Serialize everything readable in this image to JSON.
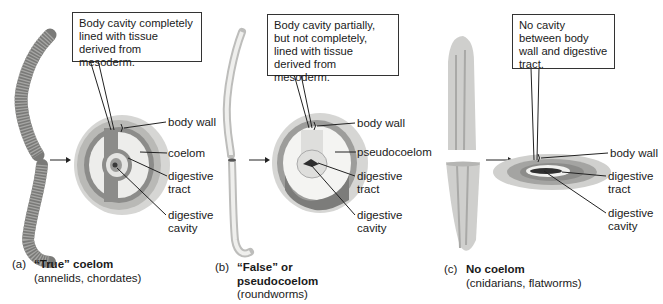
{
  "panels": [
    {
      "id": "a",
      "letter": "(a)",
      "title": "“True” coelom",
      "title_line2": "",
      "subtitle": "(annelids, chordates)",
      "callout": "Body cavity completely lined with tissue derived from mesoderm.",
      "organism": "annelid earthworm",
      "labels": [
        "body wall",
        "coelom",
        "digestive tract",
        "digestive cavity"
      ]
    },
    {
      "id": "b",
      "letter": "(b)",
      "title": "“False” or",
      "title_line2": "pseudocoelom",
      "subtitle": "(roundworms)",
      "callout": "Body cavity partially, but not completely, lined with tissue derived from mesoderm.",
      "organism": "roundworm",
      "labels": [
        "body wall",
        "pseudocoelom",
        "digestive tract",
        "digestive cavity"
      ]
    },
    {
      "id": "c",
      "letter": "(c)",
      "title": "No coelom",
      "title_line2": "",
      "subtitle": "(cnidarians, flatworms)",
      "callout": "No cavity between body wall and digestive tract.",
      "organism": "flatworm",
      "labels": [
        "body wall",
        "digestive tract",
        "digestive cavity"
      ]
    }
  ],
  "colors": {
    "outer_wall": "#d6d6d4",
    "wall_mid": "#b9b9b6",
    "mesoderm": "#8c8c8a",
    "gut": "#e4e4e2",
    "dark": "#3a3a3a",
    "line": "#222222"
  }
}
